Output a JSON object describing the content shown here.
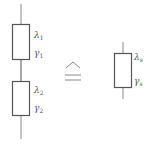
{
  "diagram": {
    "colors": {
      "stroke": "#555555",
      "line": "#888888",
      "background": "#ffffff"
    },
    "left_chain": {
      "blocks": [
        {
          "rate_symbol": "λ",
          "rate_sub": "1",
          "gamma_symbol": "γ",
          "gamma_sub": "1"
        },
        {
          "rate_symbol": "λ",
          "rate_sub": "2",
          "gamma_symbol": "γ",
          "gamma_sub": "2"
        }
      ]
    },
    "equivalence_symbol": "≙",
    "right_block": {
      "rate_symbol": "λ",
      "rate_sub": "s",
      "gamma_symbol": "γ",
      "gamma_sub": "s"
    }
  }
}
